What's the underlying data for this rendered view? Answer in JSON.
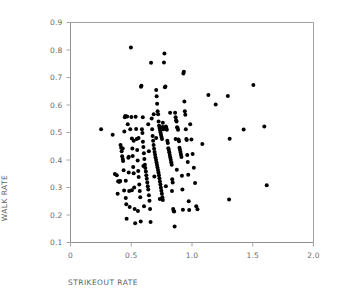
{
  "chart_data": {
    "type": "scatter",
    "title": "",
    "xlabel": "STRIKEOUT RATE",
    "ylabel": "WALK RATE",
    "xlim": [
      0,
      2.0
    ],
    "ylim": [
      0.1,
      0.9
    ],
    "xticks": [
      "0",
      "0.5",
      "1.0",
      "1.5",
      "2.0"
    ],
    "xtick_values": [
      0,
      0.5,
      1.0,
      1.5,
      2.0
    ],
    "yticks": [
      "0.1",
      "0.2",
      "0.3",
      "0.4",
      "0.5",
      "0.6",
      "0.7",
      "0.8",
      "0.9"
    ],
    "ytick_values": [
      0.1,
      0.2,
      0.3,
      0.4,
      0.5,
      0.6,
      0.7,
      0.8,
      0.9
    ],
    "grid": false,
    "legend": null,
    "marker_color": "#000000",
    "marker_size": 3.1,
    "frame_color": "#9a9a9a",
    "series": [
      {
        "name": "players",
        "points": [
          [
            0.252,
            0.512
          ],
          [
            0.347,
            0.492
          ],
          [
            0.365,
            0.349
          ],
          [
            0.381,
            0.345
          ],
          [
            0.392,
            0.323
          ],
          [
            0.399,
            0.321
          ],
          [
            0.404,
            0.322
          ],
          [
            0.409,
            0.324
          ],
          [
            0.388,
            0.277
          ],
          [
            0.412,
            0.455
          ],
          [
            0.417,
            0.445
          ],
          [
            0.421,
            0.432
          ],
          [
            0.425,
            0.414
          ],
          [
            0.43,
            0.404
          ],
          [
            0.433,
            0.396
          ],
          [
            0.437,
            0.363
          ],
          [
            0.441,
            0.289
          ],
          [
            0.443,
            0.504
          ],
          [
            0.447,
            0.555
          ],
          [
            0.451,
            0.56
          ],
          [
            0.455,
            0.262
          ],
          [
            0.459,
            0.239
          ],
          [
            0.462,
            0.186
          ],
          [
            0.466,
            0.558
          ],
          [
            0.471,
            0.53
          ],
          [
            0.476,
            0.408
          ],
          [
            0.479,
            0.355
          ],
          [
            0.483,
            0.287
          ],
          [
            0.487,
            0.229
          ],
          [
            0.492,
            0.512
          ],
          [
            0.497,
            0.809
          ],
          [
            0.501,
            0.556
          ],
          [
            0.505,
            0.478
          ],
          [
            0.509,
            0.442
          ],
          [
            0.512,
            0.415
          ],
          [
            0.516,
            0.375
          ],
          [
            0.52,
            0.352
          ],
          [
            0.524,
            0.3
          ],
          [
            0.528,
            0.222
          ],
          [
            0.532,
            0.17
          ],
          [
            0.536,
            0.557
          ],
          [
            0.54,
            0.513
          ],
          [
            0.545,
            0.476
          ],
          [
            0.549,
            0.436
          ],
          [
            0.553,
            0.398
          ],
          [
            0.557,
            0.36
          ],
          [
            0.561,
            0.338
          ],
          [
            0.566,
            0.311
          ],
          [
            0.57,
            0.287
          ],
          [
            0.574,
            0.265
          ],
          [
            0.578,
            0.176
          ],
          [
            0.58,
            0.666
          ],
          [
            0.584,
            0.67
          ],
          [
            0.588,
            0.512
          ],
          [
            0.592,
            0.498
          ],
          [
            0.596,
            0.466
          ],
          [
            0.6,
            0.447
          ],
          [
            0.604,
            0.425
          ],
          [
            0.608,
            0.404
          ],
          [
            0.612,
            0.383
          ],
          [
            0.616,
            0.371
          ],
          [
            0.62,
            0.358
          ],
          [
            0.624,
            0.345
          ],
          [
            0.628,
            0.332
          ],
          [
            0.632,
            0.318
          ],
          [
            0.636,
            0.305
          ],
          [
            0.64,
            0.293
          ],
          [
            0.645,
            0.272
          ],
          [
            0.65,
            0.252
          ],
          [
            0.655,
            0.222
          ],
          [
            0.659,
            0.175
          ],
          [
            0.663,
            0.754
          ],
          [
            0.668,
            0.551
          ],
          [
            0.672,
            0.512
          ],
          [
            0.676,
            0.487
          ],
          [
            0.68,
            0.47
          ],
          [
            0.684,
            0.455
          ],
          [
            0.688,
            0.441
          ],
          [
            0.692,
            0.429
          ],
          [
            0.696,
            0.419
          ],
          [
            0.7,
            0.409
          ],
          [
            0.704,
            0.4
          ],
          [
            0.708,
            0.391
          ],
          [
            0.712,
            0.382
          ],
          [
            0.716,
            0.373
          ],
          [
            0.72,
            0.364
          ],
          [
            0.724,
            0.355
          ],
          [
            0.728,
            0.345
          ],
          [
            0.732,
            0.334
          ],
          [
            0.736,
            0.322
          ],
          [
            0.74,
            0.311
          ],
          [
            0.744,
            0.299
          ],
          [
            0.748,
            0.288
          ],
          [
            0.752,
            0.277
          ],
          [
            0.756,
            0.265
          ],
          [
            0.76,
            0.255
          ],
          [
            0.705,
            0.655
          ],
          [
            0.709,
            0.632
          ],
          [
            0.713,
            0.605
          ],
          [
            0.717,
            0.577
          ],
          [
            0.721,
            0.566
          ],
          [
            0.725,
            0.54
          ],
          [
            0.729,
            0.525
          ],
          [
            0.733,
            0.516
          ],
          [
            0.737,
            0.508
          ],
          [
            0.741,
            0.5
          ],
          [
            0.745,
            0.492
          ],
          [
            0.749,
            0.484
          ],
          [
            0.753,
            0.476
          ],
          [
            0.757,
            0.52
          ],
          [
            0.761,
            0.518
          ],
          [
            0.765,
            0.512
          ],
          [
            0.769,
            0.755
          ],
          [
            0.773,
            0.787
          ],
          [
            0.777,
            0.665
          ],
          [
            0.781,
            0.667
          ],
          [
            0.785,
            0.522
          ],
          [
            0.789,
            0.516
          ],
          [
            0.793,
            0.51
          ],
          [
            0.797,
            0.47
          ],
          [
            0.801,
            0.462
          ],
          [
            0.805,
            0.443
          ],
          [
            0.809,
            0.436
          ],
          [
            0.813,
            0.428
          ],
          [
            0.817,
            0.418
          ],
          [
            0.821,
            0.409
          ],
          [
            0.825,
            0.401
          ],
          [
            0.829,
            0.392
          ],
          [
            0.833,
            0.383
          ],
          [
            0.837,
            0.33
          ],
          [
            0.841,
            0.318
          ],
          [
            0.845,
            0.222
          ],
          [
            0.849,
            0.215
          ],
          [
            0.853,
            0.213
          ],
          [
            0.857,
            0.158
          ],
          [
            0.861,
            0.572
          ],
          [
            0.865,
            0.555
          ],
          [
            0.869,
            0.545
          ],
          [
            0.873,
            0.54
          ],
          [
            0.877,
            0.519
          ],
          [
            0.881,
            0.516
          ],
          [
            0.885,
            0.51
          ],
          [
            0.889,
            0.475
          ],
          [
            0.893,
            0.468
          ],
          [
            0.897,
            0.445
          ],
          [
            0.901,
            0.437
          ],
          [
            0.905,
            0.429
          ],
          [
            0.909,
            0.42
          ],
          [
            0.913,
            0.411
          ],
          [
            0.917,
            0.343
          ],
          [
            0.921,
            0.293
          ],
          [
            0.925,
            0.219
          ],
          [
            0.929,
            0.715
          ],
          [
            0.933,
            0.721
          ],
          [
            0.937,
            0.613
          ],
          [
            0.941,
            0.577
          ],
          [
            0.945,
            0.565
          ],
          [
            0.949,
            0.512
          ],
          [
            0.953,
            0.476
          ],
          [
            0.957,
            0.473
          ],
          [
            0.961,
            0.418
          ],
          [
            0.965,
            0.393
          ],
          [
            0.969,
            0.346
          ],
          [
            0.973,
            0.25
          ],
          [
            0.977,
            0.218
          ],
          [
            0.985,
            0.53
          ],
          [
            0.995,
            0.475
          ],
          [
            1.005,
            0.422
          ],
          [
            1.015,
            0.372
          ],
          [
            1.025,
            0.316
          ],
          [
            1.035,
            0.232
          ],
          [
            1.045,
            0.221
          ],
          [
            1.085,
            0.458
          ],
          [
            1.135,
            0.636
          ],
          [
            1.195,
            0.602
          ],
          [
            1.295,
            0.633
          ],
          [
            1.305,
            0.256
          ],
          [
            1.31,
            0.477
          ],
          [
            1.425,
            0.511
          ],
          [
            1.505,
            0.673
          ],
          [
            1.595,
            0.522
          ],
          [
            1.615,
            0.308
          ],
          [
            0.56,
            0.48
          ],
          [
            0.595,
            0.555
          ],
          [
            0.64,
            0.53
          ],
          [
            0.685,
            0.566
          ],
          [
            0.705,
            0.48
          ],
          [
            0.76,
            0.535
          ],
          [
            0.82,
            0.572
          ],
          [
            0.865,
            0.476
          ],
          [
            0.48,
            0.412
          ],
          [
            0.52,
            0.47
          ],
          [
            0.6,
            0.378
          ],
          [
            0.645,
            0.432
          ],
          [
            0.69,
            0.34
          ],
          [
            0.735,
            0.258
          ],
          [
            0.785,
            0.305
          ],
          [
            0.835,
            0.287
          ],
          [
            0.875,
            0.365
          ],
          [
            0.43,
            0.442
          ],
          [
            0.455,
            0.325
          ],
          [
            0.505,
            0.29
          ],
          [
            0.555,
            0.215
          ],
          [
            0.605,
            0.232
          ]
        ]
      }
    ]
  }
}
